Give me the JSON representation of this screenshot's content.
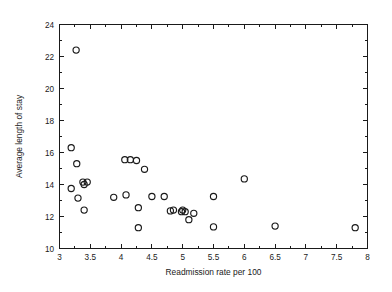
{
  "chart_data": {
    "type": "scatter",
    "title": "",
    "xlabel": "Readmission rate per 100",
    "ylabel": "Average length of stay",
    "xlim": [
      3,
      8
    ],
    "ylim": [
      10,
      24
    ],
    "xticks": [
      3,
      3.5,
      4,
      4.5,
      5,
      5.5,
      6,
      6.5,
      7,
      7.5,
      8
    ],
    "xtick_labels": [
      "3",
      "3.5",
      "4",
      "4.5",
      "5",
      "5.5",
      "6",
      "6.5",
      "7",
      "7.5",
      "8"
    ],
    "yticks": [
      10,
      12,
      14,
      16,
      18,
      20,
      22,
      24
    ],
    "ytick_labels": [
      "10",
      "12",
      "14",
      "16",
      "18",
      "20",
      "22",
      "24"
    ],
    "grid": false,
    "legend": null,
    "marker": "open-circle",
    "marker_color": "#1a1a1a",
    "points": [
      {
        "x": 3.27,
        "y": 22.4
      },
      {
        "x": 3.19,
        "y": 16.3
      },
      {
        "x": 3.28,
        "y": 15.3
      },
      {
        "x": 3.19,
        "y": 13.75
      },
      {
        "x": 3.38,
        "y": 14.15
      },
      {
        "x": 3.45,
        "y": 14.15
      },
      {
        "x": 3.4,
        "y": 14.0
      },
      {
        "x": 3.3,
        "y": 13.15
      },
      {
        "x": 3.4,
        "y": 12.4
      },
      {
        "x": 3.88,
        "y": 13.2
      },
      {
        "x": 4.06,
        "y": 15.55
      },
      {
        "x": 4.15,
        "y": 15.55
      },
      {
        "x": 4.25,
        "y": 15.5
      },
      {
        "x": 4.08,
        "y": 13.35
      },
      {
        "x": 4.28,
        "y": 12.55
      },
      {
        "x": 4.38,
        "y": 14.95
      },
      {
        "x": 4.28,
        "y": 11.3
      },
      {
        "x": 4.5,
        "y": 13.25
      },
      {
        "x": 4.7,
        "y": 13.25
      },
      {
        "x": 4.8,
        "y": 12.35
      },
      {
        "x": 4.85,
        "y": 12.4
      },
      {
        "x": 4.98,
        "y": 12.3
      },
      {
        "x": 5.0,
        "y": 12.4
      },
      {
        "x": 5.04,
        "y": 12.3
      },
      {
        "x": 5.1,
        "y": 11.8
      },
      {
        "x": 5.18,
        "y": 12.2
      },
      {
        "x": 5.5,
        "y": 13.25
      },
      {
        "x": 5.5,
        "y": 11.35
      },
      {
        "x": 6.0,
        "y": 14.35
      },
      {
        "x": 6.5,
        "y": 11.4
      },
      {
        "x": 7.8,
        "y": 11.3
      }
    ]
  }
}
